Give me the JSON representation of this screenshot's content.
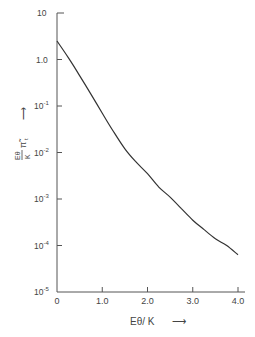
{
  "chart_data": {
    "type": "line",
    "title": "",
    "xlabel": "Eθ / K",
    "ylabel": "Eθ/K π̃_t",
    "xlabel_arrow": "→",
    "ylabel_arrow": "→",
    "xlim": [
      0,
      4.1
    ],
    "ylim": [
      1e-05,
      10
    ],
    "yscale": "log",
    "grid": false,
    "legend": null,
    "x_ticks": [
      "0",
      "1.0",
      "2.0",
      "3.0",
      "4.0"
    ],
    "y_ticks": [
      "10",
      "1.0",
      "10⁻¹",
      "10⁻²",
      "10⁻³",
      "10⁻⁴",
      "10⁻⁵"
    ],
    "series": [
      {
        "name": "curve",
        "x": [
          0.0,
          0.25,
          0.5,
          0.75,
          1.0,
          1.25,
          1.5,
          1.75,
          2.0,
          2.25,
          2.5,
          2.75,
          3.0,
          3.25,
          3.5,
          3.75,
          4.0
        ],
        "y": [
          2.5,
          1.1,
          0.45,
          0.18,
          0.07,
          0.028,
          0.012,
          0.0062,
          0.0035,
          0.0018,
          0.0011,
          0.00062,
          0.00035,
          0.00022,
          0.00014,
          0.0001,
          6.3e-05
        ]
      }
    ]
  },
  "axis": {
    "y_tick_labels": [
      {
        "base": "10",
        "exp": ""
      },
      {
        "base": "1.0",
        "exp": ""
      },
      {
        "base": "10",
        "exp": "-1"
      },
      {
        "base": "10",
        "exp": "-2"
      },
      {
        "base": "10",
        "exp": "-3"
      },
      {
        "base": "10",
        "exp": "-4"
      },
      {
        "base": "10",
        "exp": "-5"
      }
    ],
    "x_tick_labels": [
      "0",
      "1.0",
      "2.0",
      "3.0",
      "4.0"
    ],
    "x_title": "Eθ/ K",
    "arrow": "⟶",
    "y_title_num": "Eθ",
    "y_title_den": "K",
    "y_title_sym": "π̃",
    "y_title_sub": "t"
  }
}
